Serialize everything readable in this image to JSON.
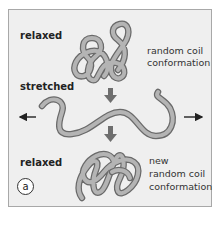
{
  "diagram": {
    "panel_label": "a",
    "stages": [
      {
        "state": "relaxed",
        "description_lines": [
          "random coil",
          "conformation"
        ]
      },
      {
        "state": "stretched",
        "description_lines": []
      },
      {
        "state": "relaxed",
        "description_lines": [
          "new",
          "random coil",
          "conformation"
        ]
      }
    ],
    "arrows": {
      "down_arrow_color": "#6e6e6e",
      "side_arrows": [
        "left",
        "right"
      ]
    },
    "colors": {
      "background": "#efefef",
      "chain_fill": "#b4b4b4",
      "chain_outline": "#6a6a6a",
      "frame_border": "#a8a8a8"
    }
  }
}
